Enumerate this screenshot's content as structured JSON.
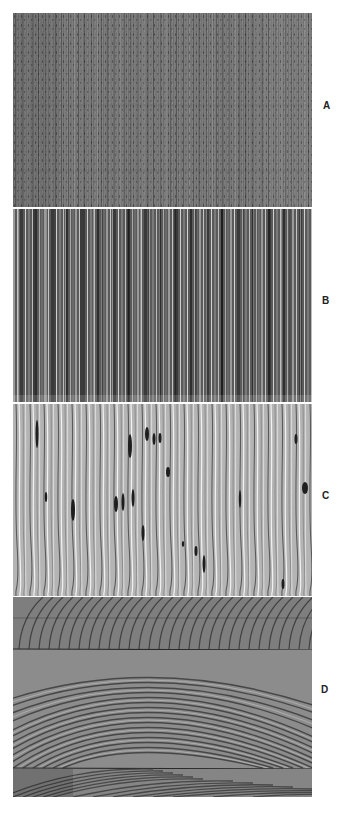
{
  "figure": {
    "panels": [
      {
        "label": "A"
      },
      {
        "label": "B"
      },
      {
        "label": "C"
      },
      {
        "label": "D"
      }
    ]
  },
  "colors": {
    "background": "#ffffff",
    "label": "#222222",
    "separator": "#ffffff"
  }
}
